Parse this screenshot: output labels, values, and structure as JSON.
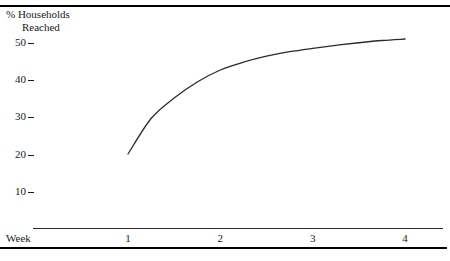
{
  "figure": {
    "y_axis_title_line1": "% Households",
    "y_axis_title_line2": "Reached",
    "x_axis_title": "Week"
  },
  "chart_data": {
    "type": "line",
    "title": "",
    "subtitle": "",
    "xlabel": "Week",
    "ylabel": "% Households Reached",
    "grid": false,
    "legend": false,
    "legend_position": "none",
    "xlim": [
      1,
      4
    ],
    "ylim": [
      0,
      55
    ],
    "x_ticks": [
      1,
      2,
      3,
      4
    ],
    "x_tick_labels": [
      "1",
      "2",
      "3",
      "4"
    ],
    "y_ticks": [
      10,
      20,
      30,
      40,
      50
    ],
    "y_tick_labels": [
      "10",
      "20",
      "30",
      "40",
      "50"
    ],
    "series": [
      {
        "name": "Cumulative reach",
        "x": [
          1,
          1.25,
          1.5,
          1.75,
          2,
          2.25,
          2.5,
          2.75,
          3,
          3.25,
          3.5,
          3.75,
          4
        ],
        "values": [
          20.0,
          29.5,
          35.0,
          39.3,
          42.5,
          44.6,
          46.2,
          47.4,
          48.3,
          49.1,
          49.8,
          50.4,
          50.8
        ]
      }
    ]
  }
}
